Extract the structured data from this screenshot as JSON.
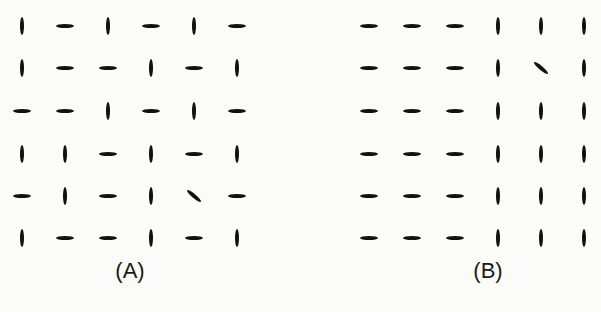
{
  "figure": {
    "panels": [
      {
        "label": "(A)",
        "grid": [
          [
            "V",
            "H",
            "V",
            "H",
            "V",
            "H"
          ],
          [
            "V",
            "H",
            "H",
            "V",
            "H",
            "V"
          ],
          [
            "H",
            "H",
            "V",
            "H",
            "V",
            "H"
          ],
          [
            "V",
            "V",
            "H",
            "V",
            "H",
            "V"
          ],
          [
            "H",
            "V",
            "H",
            "V",
            "D",
            "H"
          ],
          [
            "V",
            "H",
            "H",
            "V",
            "H",
            "V"
          ]
        ],
        "target": {
          "row": 5,
          "col": 5,
          "orientation": "diagonal"
        }
      },
      {
        "label": "(B)",
        "grid": [
          [
            "H",
            "H",
            "H",
            "V",
            "V",
            "V"
          ],
          [
            "H",
            "H",
            "H",
            "V",
            "D",
            "V"
          ],
          [
            "H",
            "H",
            "H",
            "V",
            "V",
            "V"
          ],
          [
            "H",
            "H",
            "H",
            "V",
            "V",
            "V"
          ],
          [
            "H",
            "H",
            "H",
            "V",
            "V",
            "V"
          ],
          [
            "H",
            "H",
            "H",
            "V",
            "V",
            "V"
          ]
        ],
        "target": {
          "row": 2,
          "col": 5,
          "orientation": "diagonal"
        }
      }
    ],
    "legend": {
      "V": "vertical",
      "H": "horizontal",
      "D": "diagonal"
    },
    "colors": {
      "element": "#111111",
      "background": "#fbfbfa"
    }
  }
}
